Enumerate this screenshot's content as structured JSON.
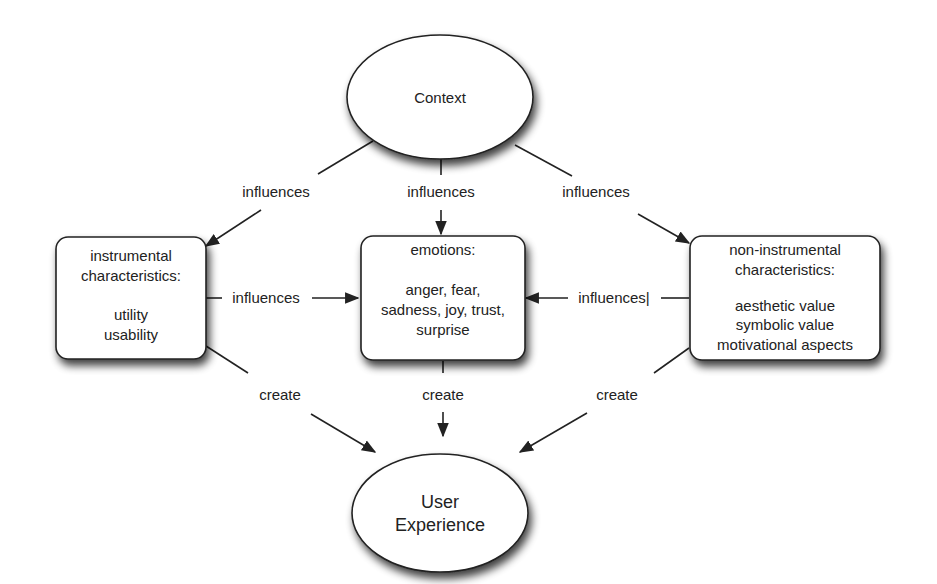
{
  "diagram": {
    "nodes": {
      "context": {
        "label": "Context"
      },
      "instrumental": {
        "title_lines": [
          "instrumental",
          "characteristics:"
        ],
        "items": [
          "utility",
          "usability"
        ]
      },
      "emotions": {
        "title_lines": [
          "emotions:"
        ],
        "items": [
          "anger, fear,",
          "sadness, joy, trust,",
          "surprise"
        ]
      },
      "non_instrumental": {
        "title_lines": [
          "non-instrumental",
          "characteristics:"
        ],
        "items": [
          "aesthetic value",
          "symbolic value",
          "motivational aspects"
        ]
      },
      "user_experience": {
        "label_lines": [
          "User",
          "Experience"
        ]
      }
    },
    "edges": {
      "context_to_instrumental": "influences",
      "context_to_emotions": "influences",
      "context_to_non_instrumental": "influences",
      "instrumental_to_emotions": "influences",
      "non_instrumental_to_emotions": "influences|",
      "instrumental_to_ux": "create",
      "emotions_to_ux": "create",
      "non_instrumental_to_ux": "create"
    },
    "colors": {
      "stroke": "#222222",
      "fill": "#ffffff",
      "shadow": "#555555"
    }
  }
}
